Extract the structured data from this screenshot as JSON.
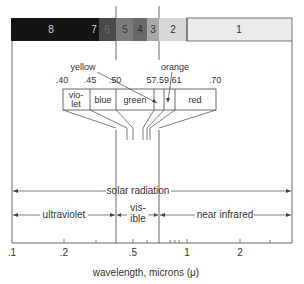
{
  "bands": [
    {
      "label": "8",
      "x": 11,
      "w": 88,
      "color": "#141414",
      "text": "#cfcfcf"
    },
    {
      "label": "7",
      "x": 88,
      "w": 11,
      "color": "#141414",
      "text": "#cfcfcf"
    },
    {
      "label": "6",
      "x": 99,
      "w": 17,
      "color": "#4a4a4a",
      "text": "#6a6a6a"
    },
    {
      "label": "5",
      "x": 116,
      "w": 17,
      "color": "#7c7c7c",
      "text": "#3a3a3a"
    },
    {
      "label": "4",
      "x": 133,
      "w": 14,
      "color": "#6a6a6a",
      "text": "#2e2e2e"
    },
    {
      "label": "3",
      "x": 147,
      "w": 12,
      "color": "#a8a8a8",
      "text": "#333333"
    },
    {
      "label": "2",
      "x": 159,
      "w": 28,
      "color": "#d8d8d8",
      "text": "#333333"
    },
    {
      "label": "1",
      "x": 187,
      "w": 105,
      "color": "#ebebeb",
      "text": "#333333"
    }
  ],
  "visible_colors": {
    "boundaries": [
      ".40",
      ".45",
      ".50",
      ".57",
      ".59",
      ".61",
      ".70"
    ],
    "segments": [
      {
        "name": "violet",
        "line1": "vio-",
        "line2": "let"
      },
      {
        "name": "blue",
        "label": "blue"
      },
      {
        "name": "green",
        "label": "green"
      },
      {
        "name": "yellow",
        "label": "yellow"
      },
      {
        "name": "orange",
        "label": "orange"
      },
      {
        "name": "red",
        "label": "red"
      }
    ],
    "boundary_label_57_59_61": "57.59.61"
  },
  "ranges": {
    "solar": "solar radiation",
    "ultraviolet": "ultraviolet",
    "visible_line1": "vis-",
    "visible_line2": "ible",
    "near_infrared": "near infrared"
  },
  "axis": {
    "ticks": [
      {
        "label": ".1",
        "x": 11
      },
      {
        "label": ".2",
        "x": 64
      },
      {
        "label": ".5",
        "x": 133
      },
      {
        "label": "1",
        "x": 187
      },
      {
        "label": "2",
        "x": 240
      }
    ],
    "title": "wavelength, microns (μ)"
  }
}
